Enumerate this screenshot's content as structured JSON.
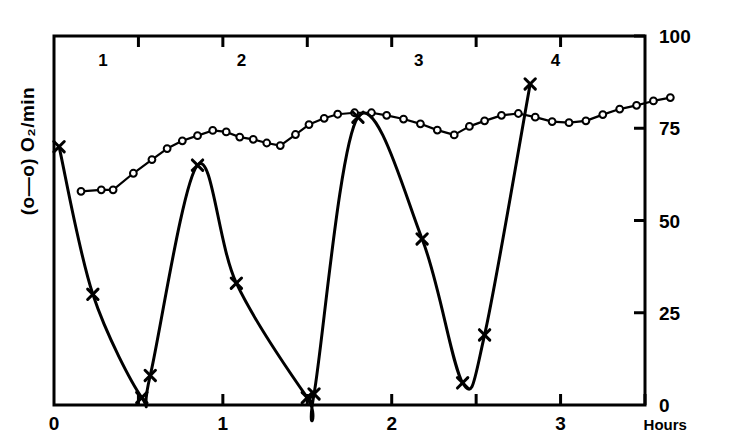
{
  "figure": {
    "background_color": "#ffffff",
    "ink_color": "#000000",
    "left_axis_label": "(o—o) O₂/min",
    "right_axis_label": "(x—x) % eggs having \"whole\" nuclei",
    "x_axis_unit_label": "Hours"
  },
  "chart_data": {
    "type": "line",
    "title": "",
    "subtitle": "",
    "xlabel": "Hours",
    "ylabel": "(o—o) O₂/min",
    "y2label": "(x—x) % eggs having \"whole\" nuclei",
    "xlim": [
      0,
      3.5
    ],
    "ylim": [
      0,
      100
    ],
    "y2lim": [
      0,
      100
    ],
    "grid": false,
    "legend_position": "none",
    "x_tick_labels": [
      "0",
      "1",
      "2",
      "3"
    ],
    "x_tick_values": [
      0,
      1,
      2,
      3
    ],
    "x_minor_tick_values": [
      0.5,
      1.5,
      2.5,
      3.5
    ],
    "y2_tick_labels": [
      "0",
      "25",
      "50",
      "75",
      "100"
    ],
    "y2_tick_values": [
      0,
      25,
      50,
      75,
      100
    ],
    "y_tick_labels": [],
    "annotations": [
      {
        "text": "1",
        "x": 0.29,
        "y": 92
      },
      {
        "text": "2",
        "x": 1.11,
        "y": 92
      },
      {
        "text": "3",
        "x": 2.16,
        "y": 92
      },
      {
        "text": "4",
        "x": 2.97,
        "y": 92
      }
    ],
    "series": [
      {
        "name": "(o—o) O₂/min",
        "marker": "open-circle",
        "axis": "left",
        "x": [
          0.16,
          0.28,
          0.35,
          0.47,
          0.58,
          0.67,
          0.76,
          0.85,
          0.94,
          1.02,
          1.1,
          1.18,
          1.26,
          1.34,
          1.43,
          1.51,
          1.6,
          1.68,
          1.78,
          1.88,
          1.97,
          2.07,
          2.17,
          2.27,
          2.37,
          2.46,
          2.55,
          2.65,
          2.75,
          2.85,
          2.95,
          3.05,
          3.15,
          3.25,
          3.35,
          3.45,
          3.55,
          3.65
        ],
        "y": [
          57.9,
          58.3,
          58.3,
          62.8,
          66.5,
          69.5,
          71.6,
          73.0,
          74.4,
          74.0,
          72.6,
          72.0,
          71.0,
          70.3,
          73.3,
          76.0,
          77.7,
          78.8,
          79.2,
          79.2,
          78.5,
          77.5,
          76.2,
          74.5,
          73.2,
          75.5,
          77.0,
          78.5,
          79.0,
          78.0,
          76.8,
          76.5,
          77.0,
          78.7,
          80.2,
          81.2,
          82.4,
          83.3
        ]
      },
      {
        "name": "(x—x) % eggs having \"whole\" nuclei",
        "marker": "x",
        "axis": "right",
        "x": [
          0.03,
          0.23,
          0.52,
          0.57,
          0.85,
          1.08,
          1.5,
          1.54,
          1.8,
          2.18,
          2.42,
          2.55,
          2.82
        ],
        "y": [
          70.0,
          30.0,
          2.0,
          8.0,
          65.0,
          33.0,
          2.0,
          3.0,
          78.0,
          45.0,
          6.0,
          19.0,
          87.0
        ]
      }
    ]
  }
}
